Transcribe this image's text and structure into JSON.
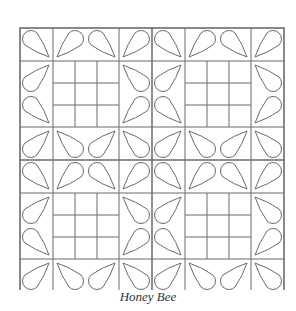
{
  "figure": {
    "caption": "Honey Bee",
    "line_color": "#6b6b6b",
    "background": "#ffffff"
  },
  "quilt": {
    "origin": [
      20,
      28
    ],
    "cell_size": 33,
    "blocks_per_side": 2,
    "block_cells": 4,
    "center_nine_patch": {
      "divisions": 3
    },
    "block_petals": [
      {
        "cell": [
          0,
          0
        ],
        "round": "TL",
        "tip": "BR"
      },
      {
        "cell": [
          1,
          0
        ],
        "round": "TR",
        "tip": "BL"
      },
      {
        "cell": [
          2,
          0
        ],
        "round": "TL",
        "tip": "BR"
      },
      {
        "cell": [
          3,
          0
        ],
        "round": "TR",
        "tip": "BL"
      },
      {
        "cell": [
          0,
          1
        ],
        "round": "BL",
        "tip": "TR"
      },
      {
        "cell": [
          0,
          2
        ],
        "round": "TL",
        "tip": "BR"
      },
      {
        "cell": [
          3,
          1
        ],
        "round": "BR",
        "tip": "TL"
      },
      {
        "cell": [
          3,
          2
        ],
        "round": "TR",
        "tip": "BL"
      },
      {
        "cell": [
          0,
          3
        ],
        "round": "BL",
        "tip": "TR"
      },
      {
        "cell": [
          1,
          3
        ],
        "round": "BR",
        "tip": "TL"
      },
      {
        "cell": [
          2,
          3
        ],
        "round": "BL",
        "tip": "TR"
      },
      {
        "cell": [
          3,
          3
        ],
        "round": "BR",
        "tip": "TL"
      }
    ]
  }
}
